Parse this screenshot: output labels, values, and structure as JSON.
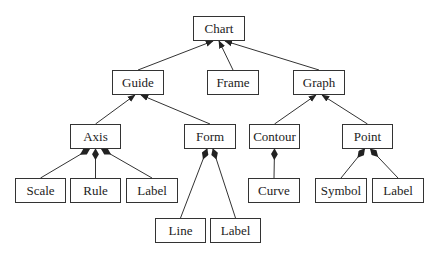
{
  "diagram": {
    "type": "class-hierarchy",
    "nodes": [
      {
        "id": "chart",
        "label": "Chart",
        "x": 193,
        "y": 16,
        "w": 52
      },
      {
        "id": "guide",
        "label": "Guide",
        "x": 112,
        "y": 70,
        "w": 52
      },
      {
        "id": "frame",
        "label": "Frame",
        "x": 207,
        "y": 70,
        "w": 52
      },
      {
        "id": "graph",
        "label": "Graph",
        "x": 293,
        "y": 70,
        "w": 52
      },
      {
        "id": "axis",
        "label": "Axis",
        "x": 70,
        "y": 124,
        "w": 51
      },
      {
        "id": "form",
        "label": "Form",
        "x": 184,
        "y": 124,
        "w": 52
      },
      {
        "id": "contour",
        "label": "Contour",
        "x": 249,
        "y": 124,
        "w": 51
      },
      {
        "id": "point",
        "label": "Point",
        "x": 342,
        "y": 124,
        "w": 51
      },
      {
        "id": "scale",
        "label": "Scale",
        "x": 15,
        "y": 178,
        "w": 51
      },
      {
        "id": "rule",
        "label": "Rule",
        "x": 70,
        "y": 178,
        "w": 51
      },
      {
        "id": "axis_label",
        "label": "Label",
        "x": 126,
        "y": 178,
        "w": 52
      },
      {
        "id": "curve",
        "label": "Curve",
        "x": 248,
        "y": 178,
        "w": 52
      },
      {
        "id": "symbol",
        "label": "Symbol",
        "x": 315,
        "y": 178,
        "w": 52
      },
      {
        "id": "point_label",
        "label": "Label",
        "x": 372,
        "y": 178,
        "w": 52
      },
      {
        "id": "line",
        "label": "Line",
        "x": 155,
        "y": 218,
        "w": 51
      },
      {
        "id": "form_label",
        "label": "Label",
        "x": 210,
        "y": 218,
        "w": 51
      }
    ],
    "edges": [
      {
        "from": "guide",
        "to": "chart",
        "head": "arrow"
      },
      {
        "from": "frame",
        "to": "chart",
        "head": "arrow"
      },
      {
        "from": "graph",
        "to": "chart",
        "head": "arrow"
      },
      {
        "from": "axis",
        "to": "guide",
        "head": "arrow"
      },
      {
        "from": "form",
        "to": "guide",
        "head": "arrow"
      },
      {
        "from": "contour",
        "to": "graph",
        "head": "arrow"
      },
      {
        "from": "point",
        "to": "graph",
        "head": "arrow"
      },
      {
        "from": "scale",
        "to": "axis",
        "head": "diamond"
      },
      {
        "from": "rule",
        "to": "axis",
        "head": "diamond"
      },
      {
        "from": "axis_label",
        "to": "axis",
        "head": "diamond"
      },
      {
        "from": "curve",
        "to": "contour",
        "head": "diamond"
      },
      {
        "from": "symbol",
        "to": "point",
        "head": "diamond"
      },
      {
        "from": "point_label",
        "to": "point",
        "head": "diamond"
      },
      {
        "from": "line",
        "to": "form",
        "head": "diamond"
      },
      {
        "from": "form_label",
        "to": "form",
        "head": "diamond"
      }
    ]
  },
  "colors": {
    "line": "#333333",
    "text": "#222222",
    "background": "#ffffff"
  }
}
